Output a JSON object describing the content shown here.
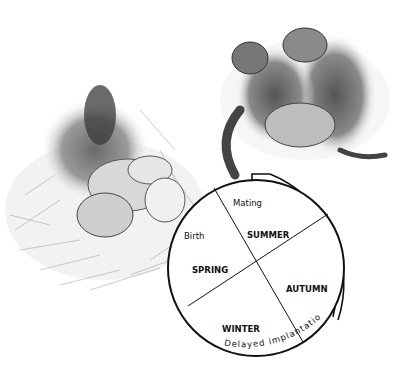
{
  "diagram": {
    "type": "annual-life-cycle-wheel",
    "seasons": [
      {
        "name": "SUMMER"
      },
      {
        "name": "AUTUMN"
      },
      {
        "name": "WINTER"
      },
      {
        "name": "SPRING"
      }
    ],
    "events": [
      {
        "name": "Mating"
      },
      {
        "name": "Birth"
      }
    ],
    "arc_label": "Delayed implantation",
    "illustrations": [
      {
        "name": "mother-with-young-in-nest",
        "position": "left"
      },
      {
        "name": "mating-pair",
        "position": "top-right"
      }
    ],
    "colors": {
      "line": "#111111",
      "background": "#ffffff",
      "sketch": "#555555"
    }
  }
}
